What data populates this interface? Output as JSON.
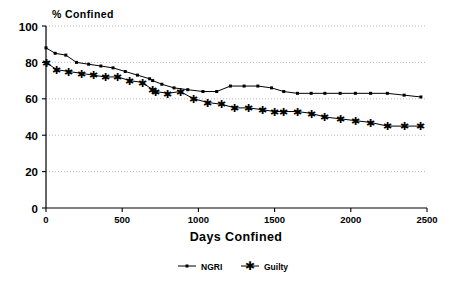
{
  "chart_data": {
    "type": "line",
    "title": "",
    "xlabel": "Days Confined",
    "ylabel": "% Confined",
    "xlim": [
      0,
      2500
    ],
    "ylim": [
      0,
      100
    ],
    "xticks": [
      0,
      500,
      1000,
      1500,
      2000,
      2500
    ],
    "yticks": [
      0,
      20,
      40,
      60,
      80,
      100
    ],
    "xtick_labels": [
      "0",
      "500",
      "1000",
      "1500",
      "2000",
      "2500"
    ],
    "ytick_labels": [
      "0",
      "20",
      "40",
      "60",
      "80",
      "100"
    ],
    "grid": "horizontal-dotted",
    "legend_position": "below-axis-center",
    "series": [
      {
        "name": "NGRI",
        "marker": "square-dot",
        "color": "#000000",
        "x": [
          0,
          60,
          130,
          200,
          280,
          360,
          440,
          520,
          600,
          680,
          700,
          760,
          840,
          930,
          1030,
          1120,
          1210,
          1300,
          1390,
          1480,
          1560,
          1650,
          1740,
          1830,
          1930,
          2030,
          2130,
          2240,
          2350,
          2460
        ],
        "y": [
          88,
          85,
          84,
          80,
          79,
          78,
          77,
          75,
          73,
          71,
          70,
          68,
          66,
          65,
          64,
          64,
          67,
          67,
          67,
          66,
          64,
          63,
          63,
          63,
          63,
          63,
          63,
          63,
          62,
          61
        ]
      },
      {
        "name": "Guilty",
        "marker": "asterisk",
        "color": "#000000",
        "x": [
          0,
          70,
          150,
          230,
          310,
          390,
          470,
          550,
          630,
          700,
          720,
          800,
          880,
          970,
          1060,
          1150,
          1240,
          1330,
          1420,
          1500,
          1560,
          1650,
          1740,
          1830,
          1930,
          2030,
          2130,
          2240,
          2350,
          2460
        ],
        "y": [
          80,
          76,
          75,
          74,
          73,
          72,
          72,
          70,
          69,
          65,
          64,
          63,
          64,
          60,
          58,
          57,
          55,
          55,
          54,
          53,
          53,
          53,
          52,
          50,
          49,
          48,
          47,
          45,
          45,
          45
        ]
      }
    ]
  },
  "legend": {
    "items": [
      {
        "label": "NGRI",
        "marker": "dot"
      },
      {
        "label": "Guilty",
        "marker": "asterisk"
      }
    ]
  },
  "labels": {
    "y_axis_title": "% Confined",
    "x_axis_title": "Days Confined"
  }
}
